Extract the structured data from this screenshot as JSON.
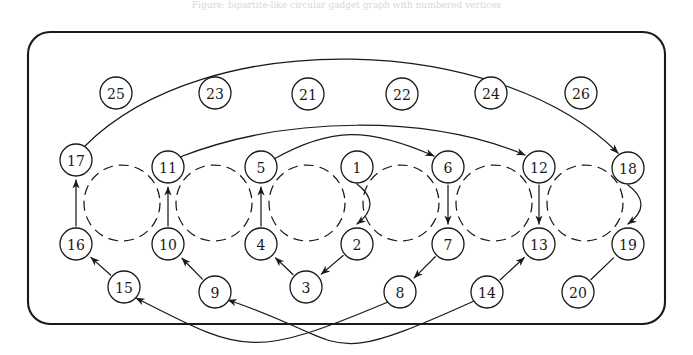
{
  "caption": "Figure: bipartite-like circular gadget graph with numbered vertices",
  "figure": {
    "background_color": "#ffffff",
    "ink_color": "#1a1a1a",
    "frame": {
      "name": "rounded-rectangle-border",
      "x": 28,
      "y": 32,
      "width": 637,
      "height": 292,
      "radius": 22
    }
  },
  "chart_data": {
    "type": "diagram",
    "node_radius": 16,
    "dashed_ring_radius": 38,
    "nodes": [
      {
        "id": 1,
        "label": "1",
        "x": 357,
        "y": 167,
        "row": "upper"
      },
      {
        "id": 2,
        "label": "2",
        "x": 357,
        "y": 244,
        "row": "lower"
      },
      {
        "id": 3,
        "label": "3",
        "x": 306,
        "y": 287,
        "row": "bottom"
      },
      {
        "id": 4,
        "label": "4",
        "x": 261,
        "y": 244,
        "row": "lower"
      },
      {
        "id": 5,
        "label": "5",
        "x": 261,
        "y": 167,
        "row": "upper"
      },
      {
        "id": 6,
        "label": "6",
        "x": 448,
        "y": 167,
        "row": "upper"
      },
      {
        "id": 7,
        "label": "7",
        "x": 448,
        "y": 244,
        "row": "lower"
      },
      {
        "id": 8,
        "label": "8",
        "x": 400,
        "y": 292,
        "row": "bottom"
      },
      {
        "id": 9,
        "label": "9",
        "x": 215,
        "y": 292,
        "row": "bottom"
      },
      {
        "id": 10,
        "label": "10",
        "x": 168,
        "y": 244,
        "row": "lower"
      },
      {
        "id": 11,
        "label": "11",
        "x": 168,
        "y": 167,
        "row": "upper"
      },
      {
        "id": 12,
        "label": "12",
        "x": 539,
        "y": 167,
        "row": "upper"
      },
      {
        "id": 13,
        "label": "13",
        "x": 539,
        "y": 244,
        "row": "lower"
      },
      {
        "id": 14,
        "label": "14",
        "x": 487,
        "y": 292,
        "row": "bottom"
      },
      {
        "id": 15,
        "label": "15",
        "x": 124,
        "y": 287,
        "row": "bottom"
      },
      {
        "id": 16,
        "label": "16",
        "x": 76,
        "y": 244,
        "row": "lower"
      },
      {
        "id": 17,
        "label": "17",
        "x": 76,
        "y": 160,
        "row": "upper"
      },
      {
        "id": 18,
        "label": "18",
        "x": 628,
        "y": 168,
        "row": "upper"
      },
      {
        "id": 19,
        "label": "19",
        "x": 628,
        "y": 244,
        "row": "lower"
      },
      {
        "id": 20,
        "label": "20",
        "x": 578,
        "y": 292,
        "row": "bottom"
      },
      {
        "id": 21,
        "label": "21",
        "x": 308,
        "y": 94,
        "row": "top"
      },
      {
        "id": 22,
        "label": "22",
        "x": 402,
        "y": 94,
        "row": "top"
      },
      {
        "id": 23,
        "label": "23",
        "x": 215,
        "y": 93,
        "row": "top"
      },
      {
        "id": 24,
        "label": "24",
        "x": 491,
        "y": 93,
        "row": "top"
      },
      {
        "id": 25,
        "label": "25",
        "x": 116,
        "y": 93,
        "row": "top"
      },
      {
        "id": 26,
        "label": "26",
        "x": 581,
        "y": 93,
        "row": "top"
      }
    ],
    "dashed_rings": [
      {
        "name": "ring-16-17",
        "cx": 122,
        "cy": 203,
        "r": 38
      },
      {
        "name": "ring-10-11",
        "cx": 214,
        "cy": 203,
        "r": 38
      },
      {
        "name": "ring-4-5",
        "cx": 307,
        "cy": 203,
        "r": 38
      },
      {
        "name": "ring-1-2",
        "cx": 401,
        "cy": 203,
        "r": 38
      },
      {
        "name": "ring-6-7",
        "cx": 494,
        "cy": 203,
        "r": 38
      },
      {
        "name": "ring-12-13",
        "cx": 585,
        "cy": 203,
        "r": 38
      }
    ],
    "edges": [
      {
        "name": "edge-16-to-17",
        "from": 16,
        "to": 17,
        "arrow": true,
        "style": "straight"
      },
      {
        "name": "edge-10-to-11",
        "from": 10,
        "to": 11,
        "arrow": true,
        "style": "straight"
      },
      {
        "name": "edge-4-to-5",
        "from": 4,
        "to": 5,
        "arrow": true,
        "style": "straight"
      },
      {
        "name": "edge-1-to-2",
        "from": 1,
        "to": 2,
        "arrow": true,
        "style": "curve-right"
      },
      {
        "name": "edge-6-to-7",
        "from": 6,
        "to": 7,
        "arrow": true,
        "style": "straight"
      },
      {
        "name": "edge-12-to-13",
        "from": 12,
        "to": 13,
        "arrow": true,
        "style": "straight"
      },
      {
        "name": "edge-18-to-19",
        "from": 18,
        "to": 19,
        "arrow": true,
        "style": "curve-right"
      },
      {
        "name": "edge-2-to-3",
        "from": 2,
        "to": 3,
        "arrow": true,
        "style": "straight"
      },
      {
        "name": "edge-3-to-4",
        "from": 3,
        "to": 4,
        "arrow": true,
        "style": "straight"
      },
      {
        "name": "edge-9-to-10",
        "from": 9,
        "to": 10,
        "arrow": true,
        "style": "straight"
      },
      {
        "name": "edge-15-to-16",
        "from": 15,
        "to": 16,
        "arrow": true,
        "style": "straight"
      },
      {
        "name": "edge-7-to-8",
        "from": 7,
        "to": 8,
        "arrow": true,
        "style": "straight"
      },
      {
        "name": "edge-14-to-13",
        "from": 14,
        "to": 13,
        "arrow": true,
        "style": "straight"
      },
      {
        "name": "edge-20-to-19",
        "from": 20,
        "to": 19,
        "arrow": false,
        "style": "straight"
      },
      {
        "name": "edge-11-to-12-arc",
        "from": 11,
        "to": 12,
        "arrow": true,
        "style": "long-arc-upper"
      },
      {
        "name": "edge-5-to-6-arc",
        "from": 5,
        "to": 6,
        "arrow": true,
        "style": "long-arc-lower"
      },
      {
        "name": "edge-17-to-18-arc",
        "from": 17,
        "to": 18,
        "arrow": true,
        "style": "outer-arc-top"
      },
      {
        "name": "edge-8-to-15-arc",
        "from": 8,
        "to": 15,
        "arrow": true,
        "style": "outer-arc-bottom"
      },
      {
        "name": "edge-14-to-9-arc",
        "from": 14,
        "to": 9,
        "arrow": true,
        "style": "outer-arc-bottom2"
      }
    ],
    "counts": {
      "nodes": 26,
      "edges": 19,
      "dashed_rings": 6
    }
  }
}
